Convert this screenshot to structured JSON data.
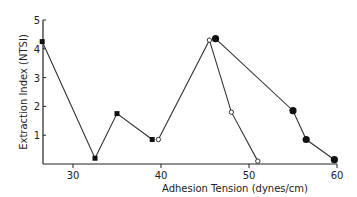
{
  "chart_data": {
    "type": "line",
    "title": "",
    "xlabel": "Adhesion Tension (dynes/cm)",
    "ylabel": "Extraction Index (NTSI)",
    "xlim": [
      25,
      60
    ],
    "ylim": [
      0,
      5
    ],
    "x_ticks": [
      "30",
      "40",
      "50",
      "60"
    ],
    "y_ticks": [
      "1",
      "2",
      "3",
      "4",
      "5"
    ],
    "grid": false,
    "legend": null,
    "series": [
      {
        "name": "series-squares",
        "marker": "filled-square",
        "x": [
          26.5,
          32.5,
          35.0,
          39.0
        ],
        "y": [
          4.25,
          0.2,
          1.75,
          0.85
        ]
      },
      {
        "name": "series-open-circles",
        "marker": "open-circle",
        "x": [
          39.7,
          45.5,
          48.0,
          51.0
        ],
        "y": [
          0.85,
          4.3,
          1.8,
          0.1
        ]
      },
      {
        "name": "series-filled-circles",
        "marker": "filled-circle",
        "x": [
          46.2,
          55.0,
          56.5,
          59.7
        ],
        "y": [
          4.35,
          1.85,
          0.85,
          0.15
        ]
      }
    ]
  }
}
